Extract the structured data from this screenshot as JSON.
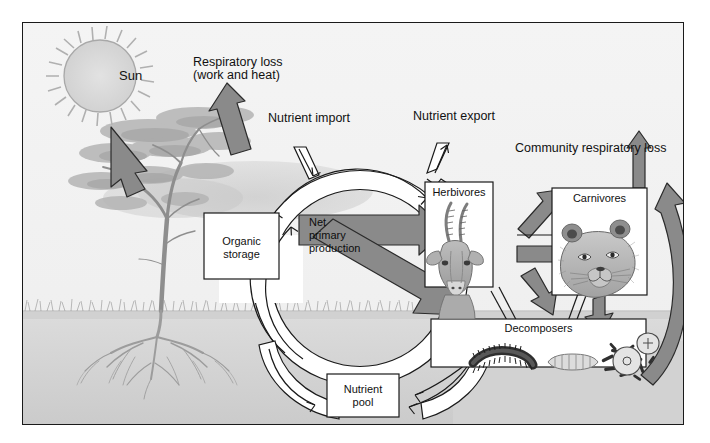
{
  "figure": {
    "frame_border_color": "#1a1a1a",
    "sky_color": "#f2f2f2",
    "soil_color": "#d8d8d8",
    "subsoil_color": "#cfcfcf",
    "gray_arrow_color": "#8a8a8a",
    "gray_arrow_stroke": "#2b2b2b",
    "white_band_fill": "#ffffff",
    "white_band_stroke": "#1a1a1a",
    "box_fill": "#ffffff",
    "box_stroke": "#1a1a1a",
    "text_color": "#111111"
  },
  "labels": {
    "sun": "Sun",
    "respiratory_loss_line1": "Respiratory loss",
    "respiratory_loss_line2": "(work and heat)",
    "nutrient_import": "Nutrient import",
    "nutrient_export": "Nutrient export",
    "community_respiratory_loss": "Community respiratory loss",
    "organic_storage_line1": "Organic",
    "organic_storage_line2": "storage",
    "net_primary_production_line1": "Net",
    "net_primary_production_line2": "primary",
    "net_primary_production_line3": "production",
    "herbivores": "Herbivores",
    "carnivores": "Carnivores",
    "decomposers": "Decomposers",
    "nutrient_pool_line1": "Nutrient",
    "nutrient_pool_line2": "pool"
  },
  "boxes": [
    {
      "id": "organic-storage",
      "label": "Organic storage",
      "x": 203,
      "y": 212,
      "w": 75,
      "h": 66
    },
    {
      "id": "herbivores",
      "label": "Herbivores",
      "x": 424,
      "y": 181,
      "w": 68,
      "h": 105
    },
    {
      "id": "carnivores",
      "label": "Carnivores",
      "x": 551,
      "y": 187,
      "w": 95,
      "h": 107
    },
    {
      "id": "decomposers",
      "label": "Decomposers",
      "x": 430,
      "y": 318,
      "w": 215,
      "h": 48
    },
    {
      "id": "nutrient-pool",
      "label": "Nutrient pool",
      "x": 326,
      "y": 373,
      "w": 72,
      "h": 43
    }
  ],
  "icons": {
    "sun": "sun-icon",
    "acacia_tree": "acacia-tree-icon",
    "tree_roots": "tree-roots-icon",
    "grass": "grass-icon",
    "gazelle_head": "gazelle-head-icon",
    "lion_head": "lion-head-icon",
    "millipede": "millipede-icon",
    "grub": "grub-larva-icon",
    "bacteria": "bacteria-icon",
    "protozoa": "protozoa-icon"
  },
  "flows": [
    {
      "id": "solar-input",
      "from": "Sun",
      "to": "Vegetation",
      "style": "gray-arrow"
    },
    {
      "id": "respiratory-loss-plants",
      "from": "Vegetation",
      "to": "Atmosphere",
      "style": "gray-arrow"
    },
    {
      "id": "nutrient-import",
      "from": "External",
      "to": "Nutrient cycle",
      "style": "thin-arrow"
    },
    {
      "id": "nutrient-export",
      "from": "Nutrient cycle",
      "to": "External",
      "style": "thin-arrow"
    },
    {
      "id": "net-primary-production-to-herbivores",
      "from": "Net primary production",
      "to": "Herbivores",
      "style": "gray-arrow"
    },
    {
      "id": "net-primary-production-to-decomposers",
      "from": "Net primary production",
      "to": "Decomposers",
      "style": "gray-arrow"
    },
    {
      "id": "herbivores-to-carnivores",
      "from": "Herbivores",
      "to": "Carnivores",
      "style": "gray-arrow"
    },
    {
      "id": "herbivores-to-decomposers",
      "from": "Herbivores",
      "to": "Decomposers",
      "style": "gray-arrow"
    },
    {
      "id": "carnivores-to-decomposers",
      "from": "Carnivores",
      "to": "Decomposers",
      "style": "gray-arrow"
    },
    {
      "id": "herbivores-respiration",
      "from": "Herbivores",
      "to": "Community respiratory loss",
      "style": "gray-arrow"
    },
    {
      "id": "carnivores-respiration",
      "from": "Carnivores",
      "to": "Community respiratory loss",
      "style": "gray-arrow"
    },
    {
      "id": "decomposers-respiration",
      "from": "Decomposers",
      "to": "Community respiratory loss",
      "style": "gray-curved-arrow"
    },
    {
      "id": "decomposers-to-nutrient-pool",
      "from": "Decomposers",
      "to": "Nutrient pool",
      "style": "thin-arrow"
    },
    {
      "id": "nutrient-pool-to-organic-storage",
      "from": "Nutrient pool",
      "to": "Organic storage",
      "style": "white-band"
    },
    {
      "id": "organic-storage-to-producers",
      "from": "Organic storage",
      "to": "Producers",
      "style": "white-band"
    }
  ]
}
